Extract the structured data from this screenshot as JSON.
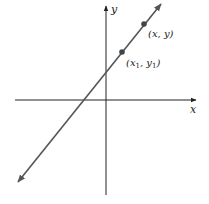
{
  "diagram": {
    "type": "coordinate-plane-line",
    "axes": {
      "x_label": "x",
      "y_label": "y",
      "x_axis": {
        "x1": 15,
        "y": 100,
        "x2": 196
      },
      "y_axis": {
        "x": 106,
        "y1": 195,
        "y2": 6
      }
    },
    "line": {
      "x1": 18,
      "y1": 182,
      "x2": 161,
      "y2": 4,
      "color": "#555555"
    },
    "points": [
      {
        "id": "p1",
        "cx": 122,
        "cy": 52,
        "label_main": "(x",
        "label_sub": "1",
        "label_mid": ", y",
        "label_sub2": "1",
        "label_end": ")",
        "label_x": 126,
        "label_y": 66
      },
      {
        "id": "p2",
        "cx": 144,
        "cy": 24,
        "label": "(x, y)",
        "label_x": 148,
        "label_y": 37
      }
    ],
    "colors": {
      "axis": "#222222",
      "line": "#555555",
      "point": "#444444"
    }
  }
}
